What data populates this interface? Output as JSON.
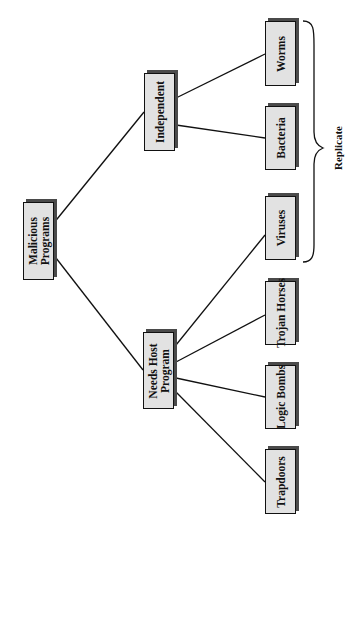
{
  "diagram": {
    "colors": {
      "box_fill": "#e2e2e2",
      "box_border": "#111111",
      "shadow": "#4a4a4a",
      "line": "#111111"
    },
    "root": {
      "label": "Malicious\nPrograms"
    },
    "categories": [
      {
        "id": "independent",
        "label": "Independent"
      },
      {
        "id": "needs_host",
        "label": "Needs Host\nProgram"
      }
    ],
    "leaves": [
      {
        "id": "worms",
        "label": "Worms",
        "parent": "independent"
      },
      {
        "id": "bacteria",
        "label": "Bacteria",
        "parent": "independent"
      },
      {
        "id": "viruses",
        "label": "Viruses",
        "parent": "needs_host"
      },
      {
        "id": "trojan_horses",
        "label": "Trojan Horses",
        "parent": "needs_host"
      },
      {
        "id": "logic_bombs",
        "label": "Logic Bombs",
        "parent": "needs_host"
      },
      {
        "id": "trapdoors",
        "label": "Trapdoors",
        "parent": "needs_host"
      }
    ],
    "brace": {
      "label": "Replicate",
      "groups": [
        "worms",
        "bacteria",
        "viruses"
      ]
    }
  }
}
